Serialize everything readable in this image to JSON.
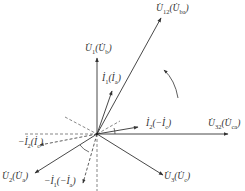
{
  "diagram": {
    "type": "phasor-diagram",
    "origin": [
      97,
      134
    ],
    "colors": {
      "line": "#333333",
      "background": "#ffffff"
    },
    "vectors": [
      {
        "id": "U12",
        "label": "U̇12(U̇ba)",
        "main": "U̇",
        "sub": "12",
        "paren_main": "U̇",
        "paren_sub": "ba",
        "end": [
          161,
          18
        ],
        "style": "solid"
      },
      {
        "id": "U1",
        "label": "U̇1(U̇b)",
        "main": "U̇",
        "sub": "1",
        "paren_main": "U̇",
        "paren_sub": "b",
        "end": [
          97,
          58
        ],
        "style": "solid"
      },
      {
        "id": "I1",
        "label": "İ1(İa)",
        "main": "İ",
        "sub": "1",
        "paren_main": "İ",
        "paren_sub": "a",
        "end": [
          112,
          91
        ],
        "style": "solid"
      },
      {
        "id": "I2",
        "label": "İ2(−İc)",
        "main": "İ",
        "sub": "2",
        "paren_main": "−İ",
        "paren_sub": "c",
        "end": [
          138,
          127
        ],
        "style": "solid"
      },
      {
        "id": "U32",
        "label": "U̇32(U̇ca)",
        "main": "U̇",
        "sub": "32",
        "paren_main": "U̇",
        "paren_sub": "ca",
        "end": [
          228,
          134
        ],
        "style": "solid"
      },
      {
        "id": "U3",
        "label": "U̇3(U̇c)",
        "main": "U̇",
        "sub": "3",
        "paren_main": "U̇",
        "paren_sub": "c",
        "end": [
          163,
          175
        ],
        "style": "solid"
      },
      {
        "id": "U2",
        "label": "U̇2(U̇a)",
        "main": "U̇",
        "sub": "2",
        "paren_main": "U̇",
        "paren_sub": "a",
        "end": [
          35,
          173
        ],
        "style": "solid"
      },
      {
        "id": "negI1",
        "label": "−İ1(−İa)",
        "main": "−İ",
        "sub": "1",
        "paren_main": "−İ",
        "paren_sub": "a",
        "end": [
          83,
          183
        ],
        "style": "dashed"
      },
      {
        "id": "negI2",
        "label": "−İ2(İc)",
        "main": "−İ",
        "sub": "2",
        "paren_main": "İ",
        "paren_sub": "c",
        "end": [
          40,
          145
        ],
        "style": "dashed"
      }
    ],
    "reference_lines": [
      {
        "from": [
          25,
          134
        ],
        "to": [
          97,
          134
        ],
        "style": "dashed"
      },
      {
        "from": [
          97,
          134
        ],
        "to": [
          97,
          191
        ],
        "style": "dashed"
      },
      {
        "from": [
          60,
          112
        ],
        "to": [
          118,
          121
        ],
        "style": "dashed"
      },
      {
        "from": [
          97,
          134
        ],
        "to": [
          118,
          121
        ],
        "style": "dashed"
      }
    ],
    "annotations": {
      "rotation_direction": "counterclockwise",
      "angle_arcs": [
        "between U32 and I2",
        "between U2 and -I1"
      ]
    }
  }
}
